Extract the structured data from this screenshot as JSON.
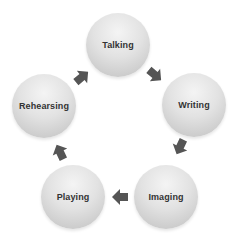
{
  "diagram": {
    "type": "cycle",
    "nodes": [
      {
        "id": "talking",
        "label": "Talking",
        "cx": 118,
        "cy": 45
      },
      {
        "id": "writing",
        "label": "Writing",
        "cx": 194,
        "cy": 105
      },
      {
        "id": "imaging",
        "label": "Imaging",
        "cx": 166,
        "cy": 197
      },
      {
        "id": "playing",
        "label": "Playing",
        "cx": 73,
        "cy": 197
      },
      {
        "id": "rehearsing",
        "label": "Rehearsing",
        "cx": 44,
        "cy": 106
      }
    ],
    "edges": [
      {
        "from": "talking",
        "to": "writing",
        "x": 155,
        "y": 75,
        "angle": 40
      },
      {
        "from": "writing",
        "to": "imaging",
        "x": 180,
        "y": 147,
        "angle": 115
      },
      {
        "from": "imaging",
        "to": "playing",
        "x": 120,
        "y": 197,
        "angle": 180
      },
      {
        "from": "playing",
        "to": "rehearsing",
        "x": 60,
        "y": 152,
        "angle": 245
      },
      {
        "from": "rehearsing",
        "to": "talking",
        "x": 82,
        "y": 77,
        "angle": 320
      }
    ],
    "colors": {
      "node_fill": "#dcdcdc",
      "label_text": "#333333",
      "arrow": "#555555"
    }
  }
}
